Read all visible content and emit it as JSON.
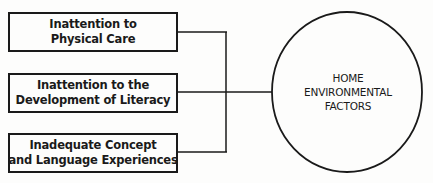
{
  "diagram": {
    "factors": [
      {
        "line1": "Inattention to",
        "line2": "Physical Care"
      },
      {
        "line1": "Inattention to the",
        "line2": "Development of Literacy"
      },
      {
        "line1": "Inadequate Concept",
        "line2": "and Language Experiences"
      }
    ],
    "central_node": {
      "line1": "HOME",
      "line2": "ENVIRONMENTAL",
      "line3": "FACTORS"
    }
  }
}
